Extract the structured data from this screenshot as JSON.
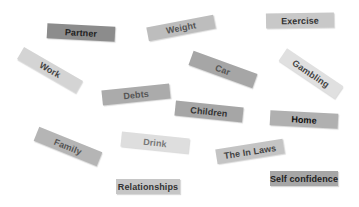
{
  "diagram": {
    "title": "",
    "background": "#ffffff",
    "labels": [
      {
        "id": "partner",
        "text": "Partner",
        "x": 47,
        "y": 25,
        "w": 68,
        "h": 15,
        "rot": 3,
        "bg": "#8c8c8c",
        "fg": "#222222"
      },
      {
        "id": "weight",
        "text": "Weight",
        "x": 147,
        "y": 21,
        "w": 68,
        "h": 14,
        "rot": -11,
        "bg": "#bdbdbd",
        "fg": "#555555"
      },
      {
        "id": "exercise",
        "text": "Exercise",
        "x": 266,
        "y": 13,
        "w": 68,
        "h": 15,
        "rot": -1,
        "bg": "#c8c8c8",
        "fg": "#333333"
      },
      {
        "id": "work",
        "text": "Work",
        "x": 16,
        "y": 63,
        "w": 68,
        "h": 14,
        "rot": 30,
        "bg": "#d4d4d4",
        "fg": "#444444"
      },
      {
        "id": "car",
        "text": "Car",
        "x": 189,
        "y": 62,
        "w": 68,
        "h": 15,
        "rot": 20,
        "bg": "#a6a6a6",
        "fg": "#555555"
      },
      {
        "id": "gambling",
        "text": "Gambling",
        "x": 277,
        "y": 66,
        "w": 68,
        "h": 15,
        "rot": 34,
        "bg": "#e0e0e0",
        "fg": "#444444"
      },
      {
        "id": "debts",
        "text": "Debts",
        "x": 102,
        "y": 87,
        "w": 68,
        "h": 15,
        "rot": -6,
        "bg": "#ababab",
        "fg": "#555555"
      },
      {
        "id": "children",
        "text": "Children",
        "x": 175,
        "y": 104,
        "w": 68,
        "h": 15,
        "rot": 6,
        "bg": "#a6a6a6",
        "fg": "#333333"
      },
      {
        "id": "home",
        "text": "Home",
        "x": 270,
        "y": 112,
        "w": 68,
        "h": 15,
        "rot": 3,
        "bg": "#b0b0b0",
        "fg": "#111111"
      },
      {
        "id": "family",
        "text": "Family",
        "x": 34,
        "y": 139,
        "w": 68,
        "h": 15,
        "rot": 22,
        "bg": "#b5b5b5",
        "fg": "#555555"
      },
      {
        "id": "drink",
        "text": "Drink",
        "x": 121,
        "y": 135,
        "w": 68,
        "h": 15,
        "rot": 6,
        "bg": "#dedede",
        "fg": "#777777"
      },
      {
        "id": "the-in-laws",
        "text": "The In Laws",
        "x": 216,
        "y": 144,
        "w": 68,
        "h": 15,
        "rot": -9,
        "bg": "#c4c4c4",
        "fg": "#444444"
      },
      {
        "id": "self-confidence",
        "text": "Self confidence",
        "x": 270,
        "y": 171,
        "w": 68,
        "h": 15,
        "rot": 0,
        "bg": "#a6a6a6",
        "fg": "#222222"
      },
      {
        "id": "relationships",
        "text": "Relationships",
        "x": 116,
        "y": 179,
        "w": 64,
        "h": 15,
        "rot": 0,
        "bg": "#c6c6c6",
        "fg": "#333333"
      }
    ]
  }
}
